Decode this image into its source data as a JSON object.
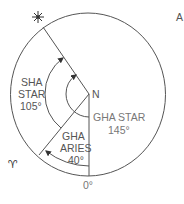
{
  "figure": {
    "corner_label": "A",
    "center_label": "N",
    "zero_label": "0°",
    "aries_symbol": "♈",
    "star_symbol": "✳",
    "sha_star": {
      "line1": "SHA",
      "line2": "STAR",
      "value": "105°"
    },
    "gha_star": {
      "line1": "GHA STAR",
      "value": "145°"
    },
    "gha_aries": {
      "line1": "GHA",
      "line2": "ARIES",
      "value": "40°"
    }
  },
  "colors": {
    "line": "#555555",
    "text": "#555555",
    "text_light": "#777777"
  }
}
